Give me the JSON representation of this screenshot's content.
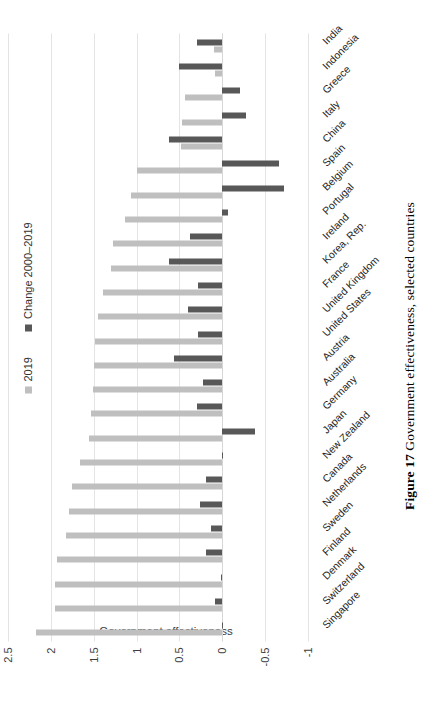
{
  "caption": {
    "figure_number": "Figure 17",
    "text": "Government effectiveness, selected countries"
  },
  "chart_data": {
    "type": "bar",
    "orientation": "horizontal",
    "title": "",
    "xlabel": "",
    "ylabel": "Government effectiveness",
    "ylim": [
      -1,
      2.5
    ],
    "yticks": [
      "2.5",
      "2",
      "1.5",
      "1",
      "0.5",
      "0",
      "-0.5",
      "-1"
    ],
    "ytick_values": [
      2.5,
      2,
      1.5,
      1,
      0.5,
      0,
      -0.5,
      -1
    ],
    "grid": true,
    "legend_position": "top-left",
    "colors": {
      "series_2019": "#bfbfbf",
      "series_change": "#585858"
    },
    "categories": [
      "Singapore",
      "Switzerland",
      "Denmark",
      "Finland",
      "Sweden",
      "Netherlands",
      "Canada",
      "New Zealand",
      "Japan",
      "Germany",
      "Australia",
      "Austria",
      "United States",
      "United Kingdom",
      "France",
      "Korea, Rep.",
      "Ireland",
      "Portugal",
      "Belgium",
      "Spain",
      "China",
      "Italy",
      "Greece",
      "Indonesia",
      "India"
    ],
    "series": [
      {
        "name": "2019",
        "values": [
          2.17,
          1.95,
          1.95,
          1.93,
          1.82,
          1.79,
          1.75,
          1.66,
          1.56,
          1.53,
          1.51,
          1.5,
          1.49,
          1.45,
          1.39,
          1.3,
          1.27,
          1.13,
          1.06,
          1.0,
          0.48,
          0.47,
          0.43,
          0.08,
          0.1
        ]
      },
      {
        "name": "Change 2000–2019",
        "values": [
          -0.01,
          0.09,
          0.02,
          0.19,
          0.13,
          0.26,
          0.19,
          -0.01,
          -0.38,
          0.3,
          0.23,
          0.56,
          0.28,
          0.4,
          0.28,
          0.62,
          0.38,
          -0.07,
          -0.72,
          -0.66,
          0.62,
          -0.28,
          -0.21,
          0.5,
          0.3
        ]
      }
    ]
  },
  "legend": {
    "items": [
      {
        "label": "2019",
        "color": "#bfbfbf"
      },
      {
        "label": "Change 2000–2019",
        "color": "#585858"
      }
    ]
  }
}
